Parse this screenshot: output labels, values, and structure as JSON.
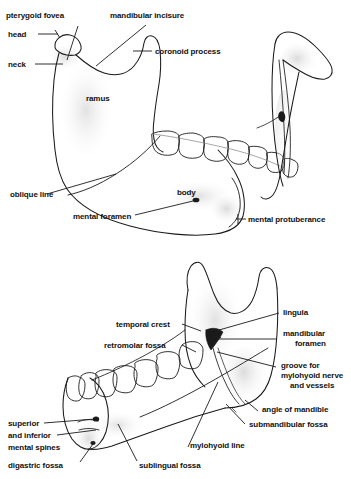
{
  "figure": {
    "background_color": "#ffffff",
    "line_color": "#1a1a1a",
    "shade_color": "#e8e8e8",
    "text_color": "#111111",
    "views": [
      {
        "name": "lateral-external-view",
        "description": "Left lateral (external) surface of the mandible"
      },
      {
        "name": "ramus-posterior-view",
        "description": "Isolated ramus seen from behind"
      },
      {
        "name": "medial-internal-view",
        "description": "Medial (internal) surface of the mandible"
      }
    ]
  },
  "upper_panel": {
    "labels": {
      "pterygoid_fovea": "pterygoid fovea",
      "mandibular_incisure": "mandibular incisure",
      "head": "head",
      "coronoid_process": "coronoid process",
      "neck": "neck",
      "ramus": "ramus",
      "oblique_line": "oblique line",
      "body": "body",
      "mental_foramen": "mental foramen",
      "mental_protuberance": "mental protuberance"
    }
  },
  "lower_panel": {
    "labels": {
      "lingula": "lingula",
      "temporal_crest": "temporal crest",
      "mandibular_foramen_l1": "mandibular",
      "mandibular_foramen_l2": "foramen",
      "retromolar_fossa": "retromolar fossa",
      "groove_l1": "groove for",
      "groove_l2": "mylohyoid nerve",
      "groove_l3": "and vessels",
      "angle_of_mandible": "angle of mandible",
      "submandibular_fossa": "submandibular fossa",
      "superior": "superior",
      "and_inferior": "and inferior",
      "mental_spines": "mental spines",
      "mylohyoid_line": "mylohyoid line",
      "digastric_fossa": "digastric fossa",
      "sublingual_fossa": "sublingual fossa"
    }
  }
}
